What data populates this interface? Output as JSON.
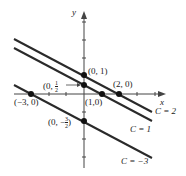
{
  "diagram": {
    "axes": {
      "x_label": "x",
      "y_label": "y"
    },
    "lines": [
      {
        "label": "C = 2",
        "equation": "x + 2y = 2"
      },
      {
        "label": "C = 1",
        "equation": "x + 2y = 1"
      },
      {
        "label": "C = -3",
        "equation": "x + 2y = -3"
      }
    ],
    "points": [
      {
        "label": "(0, 1)"
      },
      {
        "label": "(0, 1/2)"
      },
      {
        "label": "(2, 0)"
      },
      {
        "label": "(1,0)"
      },
      {
        "label": "(-3, 0)"
      },
      {
        "label": "(0, -3/2)"
      }
    ],
    "line_labels": {
      "c2": "C = 2",
      "c1": "C = 1",
      "cm3": "C = −3"
    },
    "point_labels": {
      "p01": "(0, 1)",
      "p0half_pre": "(0, ",
      "p0half_num": "1",
      "p0half_den": "2",
      "p20": "(2, 0)",
      "p10": "(1,0)",
      "pm30": "(−3, 0)",
      "p0m32_pre": "(0, −",
      "p0m32_num": "3",
      "p0m32_den": "2"
    }
  },
  "colors": {
    "line": "#2a2a2a",
    "text": "#222222",
    "background": "#ffffff"
  }
}
